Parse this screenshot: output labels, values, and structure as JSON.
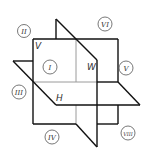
{
  "diagram": {
    "type": "three-plane projection octants",
    "colors": {
      "line": "#111111",
      "hidden_line": "#9a9a9a",
      "circle": "#555555",
      "background": "#ffffff"
    },
    "planes": [
      {
        "id": "V",
        "label": "V"
      },
      {
        "id": "W",
        "label": "W"
      },
      {
        "id": "H",
        "label": "H"
      }
    ],
    "octants": [
      {
        "id": "I",
        "label": "I"
      },
      {
        "id": "II",
        "label": "II"
      },
      {
        "id": "III",
        "label": "III"
      },
      {
        "id": "IV",
        "label": "IV"
      },
      {
        "id": "V",
        "label": "V"
      },
      {
        "id": "VI",
        "label": "VI"
      },
      {
        "id": "VIII",
        "label": "VIII"
      }
    ]
  }
}
